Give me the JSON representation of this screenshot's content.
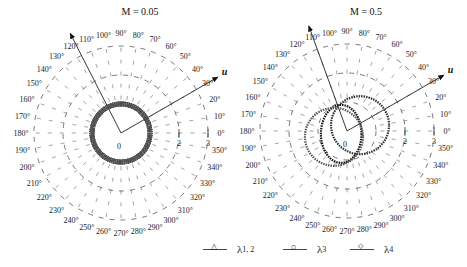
{
  "chart_data": [
    {
      "type": "polar",
      "title": "M = 0.05",
      "angle_labels": [
        "0°",
        "10°",
        "20°",
        "30°",
        "40°",
        "50°",
        "60°",
        "70°",
        "80°",
        "90°",
        "100°",
        "110°",
        "120°",
        "130°",
        "140°",
        "150°",
        "160°",
        "170°",
        "180°",
        "190°",
        "200°",
        "210°",
        "220°",
        "230°",
        "240°",
        "250°",
        "260°",
        "270°",
        "280°",
        "290°",
        "300°",
        "310°",
        "320°",
        "330°",
        "340°",
        "350°"
      ],
      "radial_ticks": [
        "1",
        "2",
        "3"
      ],
      "radial_range": [
        0,
        3
      ],
      "origin_label": "0",
      "arrows": [
        {
          "label": "u",
          "angle_deg": 30
        },
        {
          "label": "",
          "angle_deg": 117
        }
      ],
      "series": [
        {
          "name": "λ1,2",
          "marker": "triangle",
          "shape": "circle",
          "center": [
            0,
            0
          ],
          "radius": 1.0
        },
        {
          "name": "λ3",
          "marker": "circle",
          "shape": "circle",
          "center": [
            0,
            0
          ],
          "radius": 1.0
        },
        {
          "name": "λ4",
          "marker": "diamond",
          "shape": "circle",
          "center": [
            0,
            0
          ],
          "radius": 1.0
        }
      ]
    },
    {
      "type": "polar",
      "title": "M = 0.5",
      "angle_labels": [
        "0°",
        "10°",
        "20°",
        "30°",
        "40°",
        "50°",
        "60°",
        "70°",
        "80°",
        "90°",
        "100°",
        "110°",
        "120°",
        "130°",
        "140°",
        "150°",
        "160°",
        "170°",
        "180°",
        "190°",
        "200°",
        "210°",
        "220°",
        "230°",
        "240°",
        "250°",
        "260°",
        "270°",
        "280°",
        "290°",
        "300°",
        "310°",
        "320°",
        "330°",
        "340°",
        "350°"
      ],
      "radial_ticks": [
        "1",
        "2",
        "3"
      ],
      "radial_range": [
        0,
        3
      ],
      "origin_label": "0",
      "arrows": [
        {
          "label": "u",
          "angle_deg": 30
        },
        {
          "label": "",
          "angle_deg": 110
        }
      ],
      "series": [
        {
          "name": "λ1,2",
          "marker": "triangle",
          "shape": "ellipse",
          "center": [
            -0.2,
            -0.1
          ],
          "rx": 0.7,
          "ry": 1.0
        },
        {
          "name": "λ3",
          "marker": "circle",
          "shape": "circle",
          "center": [
            0.45,
            0.2
          ],
          "radius": 1.0
        },
        {
          "name": "λ4",
          "marker": "diamond",
          "shape": "circle",
          "center": [
            -0.45,
            -0.2
          ],
          "radius": 1.0
        }
      ]
    }
  ],
  "legend": {
    "items": [
      {
        "symbol": "△",
        "label": "λ",
        "sub": "1, 2"
      },
      {
        "symbol": "○",
        "label": "λ",
        "sub": "3"
      },
      {
        "symbol": "◇",
        "label": "λ",
        "sub": "4"
      }
    ]
  },
  "titles": {
    "left": "M = 0.05",
    "right": "M = 0.5"
  },
  "axis_labels": {
    "u": "u",
    "origin": "0",
    "r2": "2",
    "r3": "3"
  }
}
